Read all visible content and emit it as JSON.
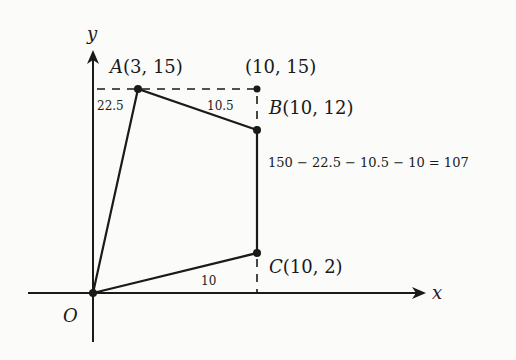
{
  "diagram": {
    "axes": {
      "x_label": "x",
      "y_label": "y",
      "origin_label": "O"
    },
    "points": {
      "A": {
        "name": "A",
        "coords": "(3, 15)"
      },
      "corner": {
        "coords": "(10, 15)"
      },
      "B": {
        "name": "B",
        "coords": "(10, 12)"
      },
      "C": {
        "name": "C",
        "coords": "(10, 2)"
      }
    },
    "area_labels": {
      "left_triangle": "22.5",
      "top_triangle": "10.5",
      "bottom_triangle": "10"
    },
    "equation": "150 − 22.5 − 10.5 − 10 = 107",
    "colors": {
      "ink": "#1a1a1a",
      "background": "#fbfbfa"
    }
  }
}
